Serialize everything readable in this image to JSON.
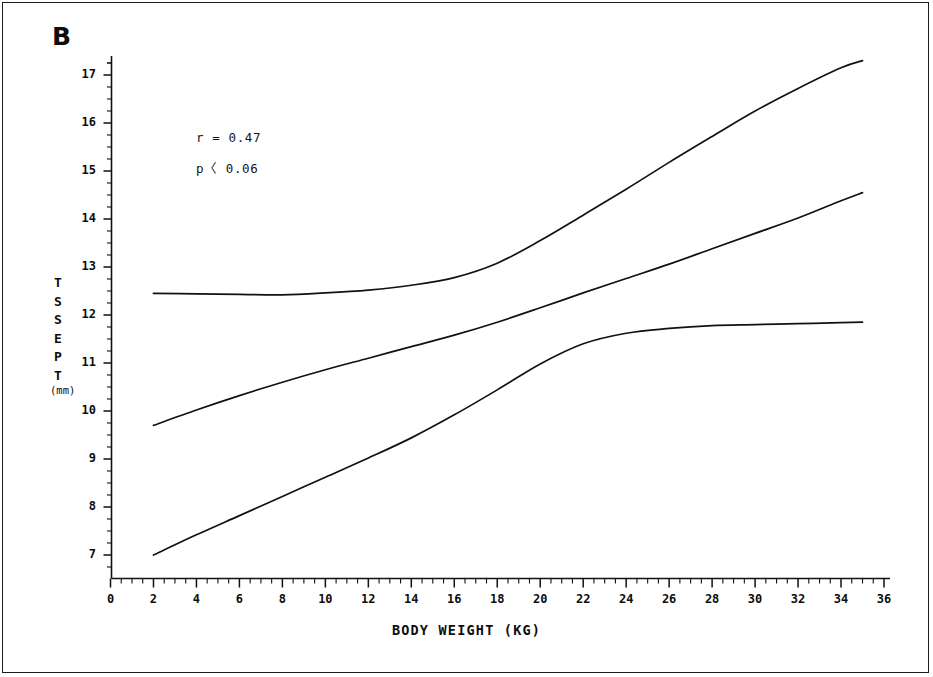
{
  "figure": {
    "panel_label": "B",
    "background": "#ffffff",
    "line_color": "#111111",
    "axis_color": "#111111"
  },
  "annotations": [
    {
      "id": "correlation",
      "text": "r = 0.47"
    },
    {
      "id": "pvalue",
      "text": "p〈 0.06"
    }
  ],
  "axes": {
    "y_title_letters": [
      "T",
      "S",
      "S",
      "E",
      "P",
      "T"
    ],
    "y_title_text": "TSSEPT",
    "y_units": "(mm)",
    "x_title": "BODY WEIGHT (KG)"
  },
  "chart_data": {
    "type": "line",
    "title": "B",
    "xlabel": "BODY WEIGHT (KG)",
    "ylabel": "TSSEPT (mm)",
    "xlim": [
      0,
      36
    ],
    "ylim": [
      6.6,
      17.6
    ],
    "xticks": [
      0,
      2,
      4,
      6,
      8,
      10,
      12,
      14,
      16,
      18,
      20,
      22,
      24,
      26,
      28,
      30,
      32,
      34,
      36
    ],
    "xticklabels": [
      "0",
      "2",
      "4",
      "6",
      "8",
      "10",
      "12",
      "14",
      "16",
      "18",
      "20",
      "22",
      "24",
      "26",
      "28",
      "30",
      "32",
      "34",
      "36"
    ],
    "yticks": [
      7,
      8,
      9,
      10,
      11,
      12,
      13,
      14,
      15,
      16,
      17
    ],
    "yticklabels": [
      "7",
      "8",
      "9",
      "10",
      "11",
      "12",
      "13",
      "14",
      "15",
      "16",
      "17"
    ],
    "x_minor_tick_step": 0.5,
    "y_minor_tick_step": 0.25,
    "grid": false,
    "legend": false,
    "annotations": [
      "r = 0.47",
      "p〈 0.06"
    ],
    "x": [
      2,
      4,
      6,
      8,
      10,
      12,
      14,
      16,
      18,
      20,
      22,
      24,
      26,
      28,
      30,
      32,
      34,
      35
    ],
    "series": [
      {
        "name": "upper-confidence-band",
        "values": [
          12.45,
          12.44,
          12.43,
          12.42,
          12.46,
          12.52,
          12.62,
          12.78,
          13.08,
          13.55,
          14.08,
          14.62,
          15.18,
          15.72,
          16.25,
          16.72,
          17.15,
          17.3
        ]
      },
      {
        "name": "regression-line",
        "values": [
          9.7,
          10.02,
          10.32,
          10.6,
          10.86,
          11.1,
          11.34,
          11.58,
          11.85,
          12.15,
          12.46,
          12.76,
          13.06,
          13.38,
          13.7,
          14.02,
          14.38,
          14.55
        ]
      },
      {
        "name": "lower-confidence-band",
        "values": [
          7.0,
          7.42,
          7.82,
          8.22,
          8.62,
          9.02,
          9.44,
          9.92,
          10.44,
          10.98,
          11.4,
          11.62,
          11.72,
          11.78,
          11.8,
          11.82,
          11.84,
          11.85
        ]
      }
    ]
  }
}
